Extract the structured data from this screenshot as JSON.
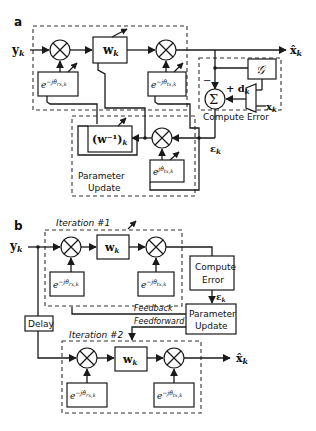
{
  "panel_a": {
    "label": "a",
    "input": "y",
    "input_sub": "k",
    "output": "x̂",
    "output_sub": "k",
    "w_block": "w",
    "w_sub": "k",
    "rx_phase": "e",
    "rx_phase_exp": "−jθ̂",
    "rx_phase_sub": "rx,k",
    "tx_phase": "e",
    "tx_phase_exp": "−jθ̂",
    "tx_phase_sub": "tx,k",
    "inv_block": "(w⁻¹)",
    "inv_sub": "k",
    "tx_conj_phase": "e",
    "tx_conj_exp": "jθ̂",
    "tx_conj_sub": "tx,k",
    "g_block": "𝒢",
    "sum_symbol": "Σ",
    "d_label": "+ d",
    "d_sub": "k",
    "minus": "−",
    "x_label": "x",
    "x_sub": "k",
    "error_label": "ε",
    "error_sub": "k",
    "compute_error_group": "Compute Error",
    "parameter_update_group_1": "Parameter",
    "parameter_update_group_2": "Update"
  },
  "panel_b": {
    "label": "b",
    "input": "y",
    "input_sub": "k",
    "output": "x̂",
    "output_sub": "k",
    "iteration1": "Iteration #1",
    "iteration2": "Iteration #2",
    "w_block": "w",
    "w_sub": "k",
    "rx_phase": "e",
    "rx_phase_exp": "−jθ̂",
    "rx_phase_sub": "rx,k",
    "tx_phase": "e",
    "tx_phase_exp": "−jθ̂",
    "tx_phase_sub": "tx,k",
    "compute_error_1": "Compute",
    "compute_error_2": "Error",
    "error_label": "ε",
    "error_sub": "k",
    "parameter_update_1": "Parameter",
    "parameter_update_2": "Update",
    "delay": "Delay",
    "feedback": "Feedback",
    "feedforward": "Feedforward"
  }
}
